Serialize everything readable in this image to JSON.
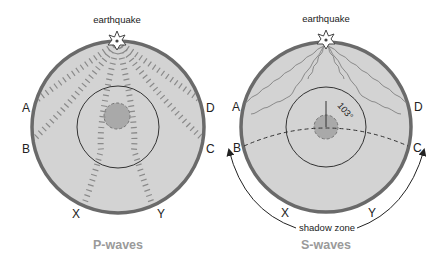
{
  "colors": {
    "mantle_fill": "#d3d3d3",
    "crust_stroke": "#6a6a6a",
    "outer_core_stroke": "#333333",
    "inner_core_fill": "#a9a9a9",
    "wave_stroke": "#8a8a8a",
    "title_text": "#9a9a9a",
    "label_text": "#222222"
  },
  "panels": [
    {
      "id": "p-waves",
      "title": "P-waves",
      "epicenter_label": "earthquake",
      "station_labels": {
        "A": "A",
        "B": "B",
        "C": "C",
        "D": "D",
        "X": "X",
        "Y": "Y"
      },
      "wave_style": "dashed compressional rays"
    },
    {
      "id": "s-waves",
      "title": "S-waves",
      "epicenter_label": "earthquake",
      "station_labels": {
        "A": "A",
        "B": "B",
        "C": "C",
        "D": "D",
        "X": "X",
        "Y": "Y"
      },
      "angle_label": "103°",
      "shadow_zone_label": "shadow zone",
      "wave_style": "wavy transverse rays"
    }
  ]
}
